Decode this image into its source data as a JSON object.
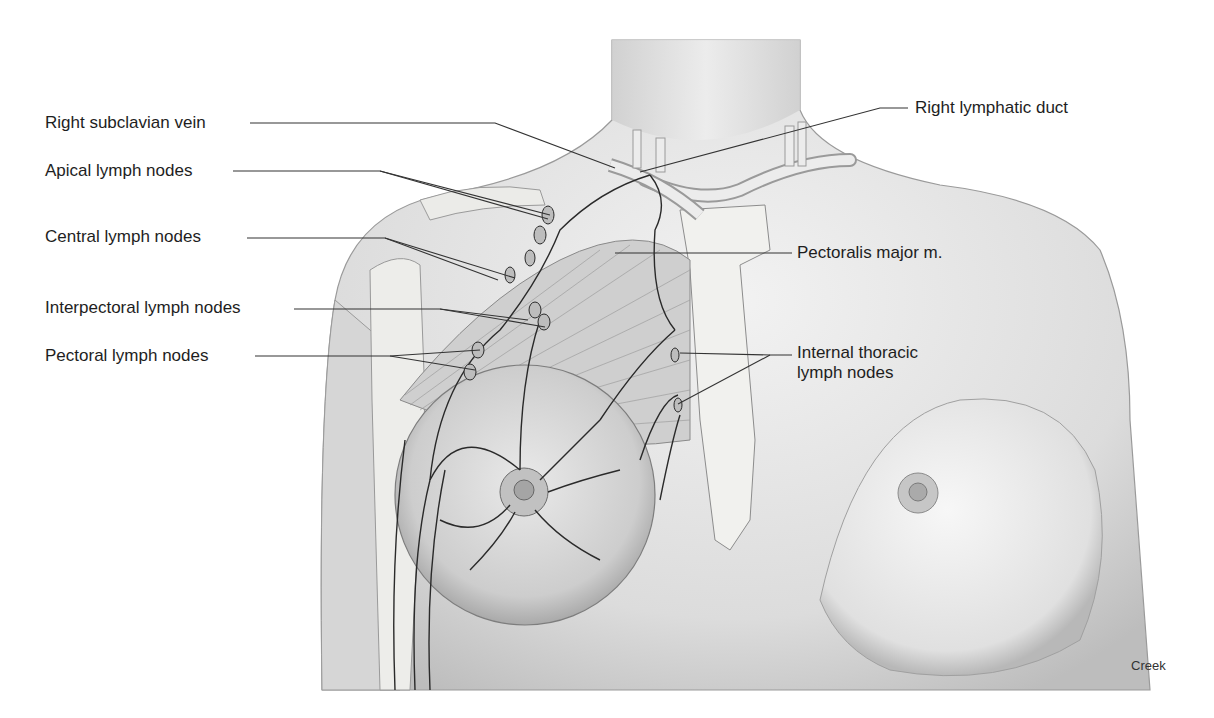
{
  "figure": {
    "colors": {
      "skin": "#e4e4e4",
      "skin_shadow": "#b9b9b9",
      "outline": "#7a7a7a",
      "lymph": "#2a2a2a",
      "leader": "#333333",
      "bone": "#f1f1ee"
    }
  },
  "labels": {
    "left": [
      {
        "id": "right-subclavian-vein",
        "text": "Right subclavian vein"
      },
      {
        "id": "apical-lymph-nodes",
        "text": "Apical lymph nodes"
      },
      {
        "id": "central-lymph-nodes",
        "text": "Central lymph nodes"
      },
      {
        "id": "interpectoral-lymph-nodes",
        "text": "Interpectoral lymph nodes"
      },
      {
        "id": "pectoral-lymph-nodes",
        "text": "Pectoral lymph nodes"
      }
    ],
    "right": [
      {
        "id": "right-lymphatic-duct",
        "text": "Right lymphatic duct"
      },
      {
        "id": "pectoralis-major",
        "text": "Pectoralis major m."
      },
      {
        "id": "internal-thoracic-lymph-nodes",
        "line1": "Internal thoracic",
        "line2": "lymph nodes"
      }
    ]
  },
  "credit": "Creek"
}
